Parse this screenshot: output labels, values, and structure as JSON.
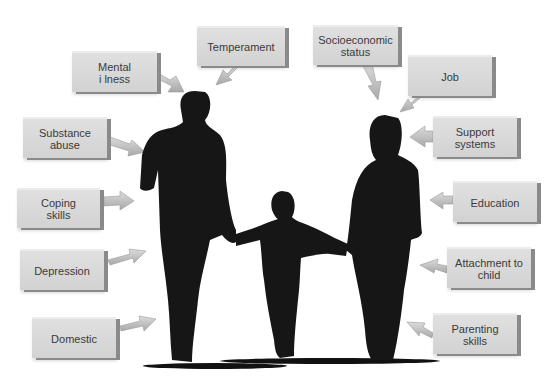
{
  "diagram": {
    "center": "Family silhouette: father, child, mother holding hands",
    "factors_left": [
      {
        "label": "Mental\ni lness"
      },
      {
        "label": "Temperament"
      },
      {
        "label": "Substance\nabuse"
      },
      {
        "label": "Coping\nskills"
      },
      {
        "label": "Depression"
      },
      {
        "label": "Domestic"
      }
    ],
    "factors_right": [
      {
        "label": "Socioeconomic\nstatus"
      },
      {
        "label": "Job"
      },
      {
        "label": "Support\nsystems"
      },
      {
        "label": "Education"
      },
      {
        "label": "Attachment to\nchild"
      },
      {
        "label": "Parenting\nskills"
      }
    ],
    "colors": {
      "box": "#d6d6d6",
      "box_edge": "#8a8a8a",
      "arrow": "#c8c8c8",
      "silhouette": "#161616"
    }
  }
}
